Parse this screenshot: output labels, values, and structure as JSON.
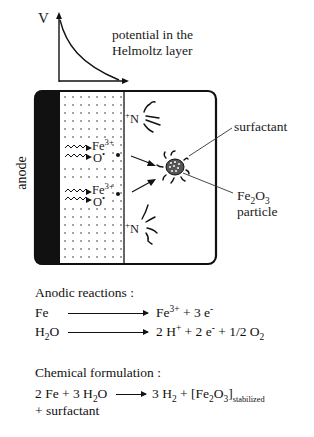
{
  "plot": {
    "axis_label": "V",
    "caption_line1": "potential in the",
    "caption_line2": "Helmoltz layer"
  },
  "cell": {
    "electrode_label": "anode",
    "ions": [
      {
        "species": "Fe",
        "charge": "3+"
      },
      {
        "species": "O",
        "charge": "•"
      },
      {
        "species": "Fe",
        "charge": "3+"
      },
      {
        "species": "O",
        "charge": "•"
      }
    ],
    "ammonium_top": {
      "charge": "+",
      "symbol": "N"
    },
    "ammonium_bottom": {
      "charge": "+",
      "symbol": "N"
    },
    "surfactant_label": "surfactant",
    "particle_label": {
      "formula_base": "Fe",
      "sub1": "2",
      "mid": "O",
      "sub2": "3",
      "word": "particle"
    }
  },
  "anodic": {
    "heading": "Anodic reactions :",
    "reactions": [
      {
        "left": "Fe",
        "right_parts": [
          "Fe",
          "3+",
          " + 3 e",
          "-"
        ]
      },
      {
        "left_parts": [
          "H",
          "2",
          "O"
        ],
        "right_parts": [
          "2 H",
          "+",
          " + 2 e",
          "-",
          " + 1/2 O",
          "2"
        ]
      }
    ]
  },
  "chemical": {
    "heading": "Chemical formulation :",
    "left_parts": [
      "2 Fe + 3 H",
      "2",
      "O"
    ],
    "right_parts": [
      "3 H",
      "2",
      " + [Fe",
      "2",
      "O",
      "3",
      "]",
      "stabilized"
    ],
    "continuation": "+ surfactant"
  },
  "colors": {
    "ink": "#111111",
    "background": "#ffffff",
    "anode_fill": "#111111"
  }
}
